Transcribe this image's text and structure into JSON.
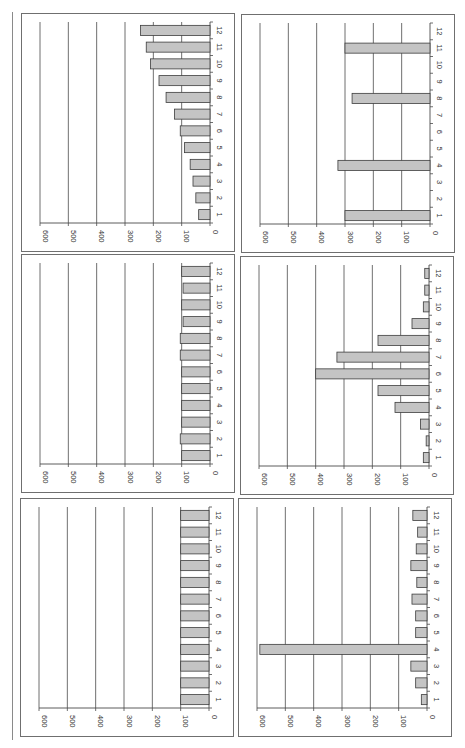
{
  "page": {
    "orientation": "rotated-90-clockwise",
    "layout": "3 rows x 2 columns of bar charts"
  },
  "style": {
    "bar_fill": "#c4c4c4",
    "bar_stroke": "#3c3c3c",
    "grid_color": "#4a4a4a",
    "border_color": "#6f6f6f",
    "text_color": "#333333"
  },
  "axis": {
    "value_ticks": [
      "600",
      "500",
      "400",
      "300",
      "200",
      "100",
      "0"
    ],
    "category_ticks": [
      "1",
      "2",
      "3",
      "4",
      "5",
      "6",
      "7",
      "8",
      "9",
      "10",
      "11",
      "12"
    ]
  },
  "chart_data": [
    {
      "id": "chart-r1-c1",
      "position": "top-left",
      "type": "bar",
      "orientation": "horizontal (page rotated)",
      "title": "",
      "xlabel": "",
      "ylabel": "",
      "categories": [
        "1",
        "2",
        "3",
        "4",
        "5",
        "6",
        "7",
        "8",
        "9",
        "10",
        "11",
        "12"
      ],
      "values": [
        40,
        50,
        60,
        70,
        90,
        105,
        125,
        155,
        180,
        210,
        225,
        245
      ],
      "ylim": [
        0,
        600
      ],
      "grid": true,
      "legend": null
    },
    {
      "id": "chart-r1-c2",
      "position": "top-right",
      "type": "bar",
      "orientation": "horizontal (page rotated)",
      "title": "",
      "xlabel": "",
      "ylabel": "",
      "categories": [
        "1",
        "2",
        "3",
        "4",
        "5",
        "6",
        "7",
        "8",
        "9",
        "10",
        "11",
        "12"
      ],
      "values": [
        300,
        0,
        0,
        325,
        0,
        0,
        0,
        275,
        0,
        0,
        300,
        0
      ],
      "ylim": [
        0,
        600
      ],
      "grid": true,
      "legend": null
    },
    {
      "id": "chart-r2-c1",
      "position": "middle-left",
      "type": "bar",
      "orientation": "horizontal (page rotated)",
      "title": "",
      "xlabel": "",
      "ylabel": "",
      "categories": [
        "1",
        "2",
        "3",
        "4",
        "5",
        "6",
        "7",
        "8",
        "9",
        "10",
        "11",
        "12"
      ],
      "values": [
        100,
        105,
        100,
        100,
        100,
        100,
        105,
        105,
        95,
        100,
        95,
        100
      ],
      "ylim": [
        0,
        600
      ],
      "grid": true,
      "legend": null
    },
    {
      "id": "chart-r2-c2",
      "position": "middle-right",
      "type": "bar",
      "orientation": "horizontal (page rotated)",
      "title": "",
      "xlabel": "",
      "ylabel": "",
      "categories": [
        "1",
        "2",
        "3",
        "4",
        "5",
        "6",
        "7",
        "8",
        "9",
        "10",
        "11",
        "12"
      ],
      "values": [
        20,
        10,
        30,
        120,
        180,
        400,
        325,
        180,
        60,
        20,
        15,
        15
      ],
      "ylim": [
        0,
        600
      ],
      "grid": true,
      "legend": null
    },
    {
      "id": "chart-r3-c1",
      "position": "bottom-left",
      "type": "bar",
      "orientation": "horizontal (page rotated)",
      "title": "",
      "xlabel": "",
      "ylabel": "",
      "categories": [
        "1",
        "2",
        "3",
        "4",
        "5",
        "6",
        "7",
        "8",
        "9",
        "10",
        "11",
        "12"
      ],
      "values": [
        100,
        100,
        100,
        100,
        100,
        100,
        100,
        100,
        100,
        100,
        100,
        100
      ],
      "ylim": [
        0,
        600
      ],
      "grid": true,
      "legend": null
    },
    {
      "id": "chart-r3-c2",
      "position": "bottom-right",
      "type": "bar",
      "orientation": "horizontal (page rotated)",
      "title": "",
      "xlabel": "",
      "ylabel": "",
      "categories": [
        "1",
        "2",
        "3",
        "4",
        "5",
        "6",
        "7",
        "8",
        "9",
        "10",
        "11",
        "12"
      ],
      "values": [
        20,
        40,
        57,
        590,
        40,
        40,
        53,
        36,
        57,
        38,
        33,
        50
      ],
      "ylim": [
        0,
        600
      ],
      "grid": true,
      "legend": null
    }
  ]
}
